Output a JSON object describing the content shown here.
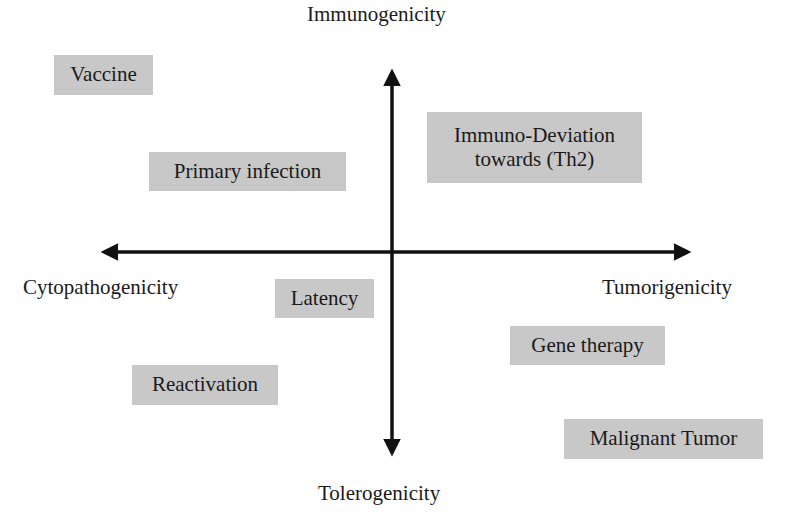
{
  "diagram": {
    "type": "quadrant-diagram",
    "colors": {
      "box_fill": "#c8c8c8",
      "axis": "#111111",
      "text": "#1a1a1a",
      "background": "#ffffff"
    },
    "axes": {
      "top": "Immunogenicity",
      "bottom": "Tolerogenicity",
      "left": "Cytopathogenicity",
      "right": "Tumorigenicity"
    },
    "boxes": {
      "vaccine": {
        "lines": [
          "Vaccine"
        ],
        "quadrant": "top-left"
      },
      "primary_infection": {
        "lines": [
          "Primary infection"
        ],
        "quadrant": "top-left"
      },
      "immuno_deviation": {
        "lines": [
          "Immuno-Deviation",
          "towards (Th2)"
        ],
        "quadrant": "top-right"
      },
      "latency": {
        "lines": [
          "Latency"
        ],
        "quadrant": "bottom-left"
      },
      "reactivation": {
        "lines": [
          "Reactivation"
        ],
        "quadrant": "bottom-left"
      },
      "gene_therapy": {
        "lines": [
          "Gene therapy"
        ],
        "quadrant": "bottom-right"
      },
      "malignant_tumor": {
        "lines": [
          "Malignant Tumor"
        ],
        "quadrant": "bottom-right"
      }
    }
  }
}
